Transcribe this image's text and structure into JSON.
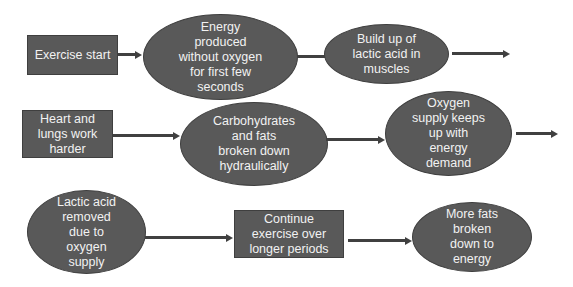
{
  "diagram": {
    "colors": {
      "node_fill": "#595959",
      "node_text": "#f2f2f2",
      "arrow": "#404040",
      "background": "#ffffff"
    },
    "nodes": [
      {
        "id": "exercise-start",
        "shape": "rectangle",
        "label": "Exercise start"
      },
      {
        "id": "energy-without-oxygen",
        "shape": "ellipse",
        "label": "Energy\nproduced\nwithout oxygen\nfor first few\nseconds"
      },
      {
        "id": "lactic-acid-buildup",
        "shape": "ellipse",
        "label": "Build up of\nlactic acid in\nmuscles"
      },
      {
        "id": "heart-lungs",
        "shape": "rectangle",
        "label": "Heart and\nlungs work\nharder"
      },
      {
        "id": "carbs-fats",
        "shape": "ellipse",
        "label": "Carbohydrates\nand fats\nbroken down\nhydraulically"
      },
      {
        "id": "oxygen-supply",
        "shape": "ellipse",
        "label": "Oxygen\nsupply keeps\nup with\nenergy\ndemand"
      },
      {
        "id": "lactic-acid-removed",
        "shape": "ellipse",
        "label": "Lactic acid\nremoved\ndue to\noxygen\nsupply"
      },
      {
        "id": "continue-exercise",
        "shape": "rectangle",
        "label": "Continue\nexercise over\nlonger periods"
      },
      {
        "id": "more-fats",
        "shape": "ellipse",
        "label": "More fats\nbroken\ndown to\nenergy"
      }
    ],
    "edges": [
      {
        "from": "exercise-start",
        "to": "energy-without-oxygen"
      },
      {
        "from": "energy-without-oxygen",
        "to": "lactic-acid-buildup"
      },
      {
        "from": "lactic-acid-buildup",
        "to": "next-row"
      },
      {
        "from": "heart-lungs",
        "to": "carbs-fats"
      },
      {
        "from": "carbs-fats",
        "to": "oxygen-supply"
      },
      {
        "from": "oxygen-supply",
        "to": "next-row"
      },
      {
        "from": "lactic-acid-removed",
        "to": "continue-exercise"
      },
      {
        "from": "continue-exercise",
        "to": "more-fats"
      }
    ]
  }
}
